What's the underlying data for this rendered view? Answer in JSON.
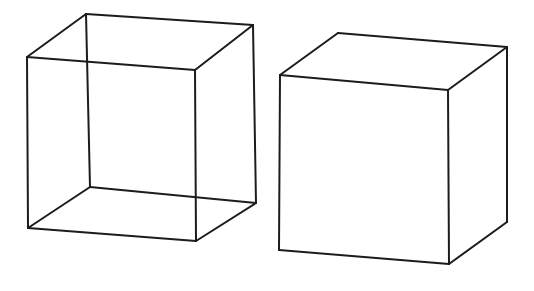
{
  "figure": {
    "background_color": "#ffffff",
    "line_color": "#1c1c1c",
    "line_width": 2,
    "width": 534,
    "height": 291
  },
  "chart_data": {
    "type": "diagram",
    "subtitle": "",
    "xlabel": "",
    "ylabel": "",
    "grid": false,
    "legend": "none",
    "objects": [
      {
        "name": "wireframe-cube",
        "label": "Necker cube (transparent wireframe)",
        "edges_visible": 12,
        "hidden_lines_drawn": true,
        "fill": "none",
        "stroke": "#1c1c1c",
        "vertices": {
          "front_top_left": [
            27,
            57
          ],
          "front_top_right": [
            195,
            70
          ],
          "front_bottom_right": [
            196,
            241
          ],
          "front_bottom_left": [
            28,
            228
          ],
          "back_top_left": [
            86,
            14
          ],
          "back_top_right": [
            253,
            25
          ],
          "back_bottom_right": [
            256,
            203
          ],
          "back_bottom_left": [
            90,
            187
          ]
        },
        "edge_list": [
          [
            "front_top_left",
            "front_top_right"
          ],
          [
            "front_top_right",
            "front_bottom_right"
          ],
          [
            "front_bottom_right",
            "front_bottom_left"
          ],
          [
            "front_bottom_left",
            "front_top_left"
          ],
          [
            "back_top_left",
            "back_top_right"
          ],
          [
            "back_top_right",
            "back_bottom_right"
          ],
          [
            "back_bottom_right",
            "back_bottom_left"
          ],
          [
            "back_bottom_left",
            "back_top_left"
          ],
          [
            "front_top_left",
            "back_top_left"
          ],
          [
            "front_top_right",
            "back_top_right"
          ],
          [
            "front_bottom_right",
            "back_bottom_right"
          ],
          [
            "front_bottom_left",
            "back_bottom_left"
          ]
        ]
      },
      {
        "name": "opaque-cube",
        "label": "Opaque cube (hidden lines removed)",
        "edges_visible": 9,
        "hidden_lines_drawn": false,
        "fill": "#ffffff",
        "stroke": "#1c1c1c",
        "vertices": {
          "front_top_left": [
            280,
            75
          ],
          "front_top_right": [
            448,
            90
          ],
          "front_bottom_right": [
            449,
            264
          ],
          "front_bottom_left": [
            279,
            250
          ],
          "back_top_left": [
            338,
            33
          ],
          "back_top_right": [
            507,
            47
          ],
          "back_bottom_right": [
            507,
            222
          ]
        },
        "edge_list": [
          [
            "front_top_left",
            "front_top_right"
          ],
          [
            "front_top_right",
            "front_bottom_right"
          ],
          [
            "front_bottom_right",
            "front_bottom_left"
          ],
          [
            "front_bottom_left",
            "front_top_left"
          ],
          [
            "back_top_left",
            "back_top_right"
          ],
          [
            "back_top_right",
            "back_bottom_right"
          ],
          [
            "front_top_left",
            "back_top_left"
          ],
          [
            "front_top_right",
            "back_top_right"
          ],
          [
            "front_bottom_right",
            "back_bottom_right"
          ]
        ]
      }
    ],
    "annotations": []
  }
}
